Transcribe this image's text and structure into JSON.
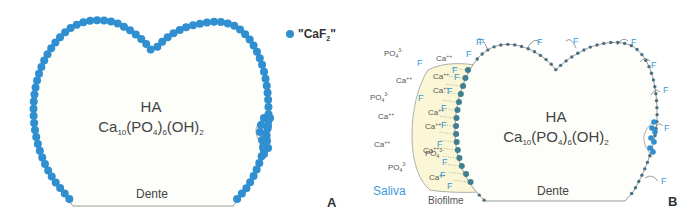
{
  "colors": {
    "caf2_dot": "#2f8fd0",
    "adsorbed_dot": "#4a6f80",
    "biofilm_fill": "#fbf7d6",
    "fluoride_text": "#3a9ad9",
    "outline": "#9a9a9a",
    "tooth_fill": "#fdfdf9"
  },
  "panel_a": {
    "letter": "A",
    "tooth_label": "Dente",
    "mineral_name": "HA",
    "formula": {
      "ca": "Ca",
      "ca_sub": "10",
      "po": "(PO",
      "po_sub1": "4",
      "po_close": ")",
      "po_sub2": "6",
      "oh": "(OH)",
      "oh_sub": "2"
    },
    "legend": {
      "label_pre": "\"CaF",
      "label_sub": "2",
      "label_post": "\""
    }
  },
  "panel_b": {
    "letter": "B",
    "tooth_label": "Dente",
    "mineral_name": "HA",
    "formula": {
      "ca": "Ca",
      "ca_sub": "10",
      "po": "(PO",
      "po_sub1": "4",
      "po_close": ")",
      "po_sub2": "6",
      "oh": "(OH)",
      "oh_sub": "2"
    },
    "saliva_label": "Saliva",
    "biofilm_label": "Biofilme",
    "ions": {
      "calcium": "Ca",
      "calcium_charge": "++",
      "phosphate": "PO",
      "phosphate_sub": "4",
      "phosphate_charge": "3-",
      "fluoride": "F"
    }
  }
}
